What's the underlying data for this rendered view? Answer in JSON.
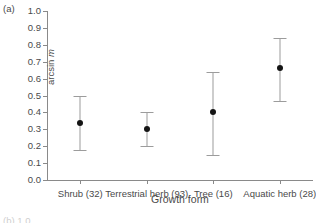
{
  "panel": {
    "letter": "(a)",
    "next_panel_letter": "(b) 1.0"
  },
  "chart_data": {
    "type": "scatter",
    "title": "",
    "xlabel": "Growth form",
    "ylabel": "arcsin m",
    "ylabel_plain": "arcsin",
    "ylabel_italic": "m",
    "ylim": [
      0.0,
      1.0
    ],
    "grid": false,
    "legend": "none",
    "error_type": "confidence-interval",
    "categories": [
      "Shrub (32)",
      "Terrestrial herb (93)",
      "Tree (16)",
      "Aquatic herb (28)"
    ],
    "category_names": [
      "Shrub",
      "Terrestrial herb",
      "Tree",
      "Aquatic herb"
    ],
    "sample_sizes": [
      32,
      93,
      16,
      28
    ],
    "values": [
      0.34,
      0.3,
      0.4,
      0.66
    ],
    "error_low": [
      0.18,
      0.2,
      0.15,
      0.47
    ],
    "error_high": [
      0.5,
      0.4,
      0.64,
      0.84
    ],
    "ytick_labels": [
      "1.0",
      "0.9",
      "0.8",
      "0.7",
      "0.6",
      "0.5",
      "0.4",
      "0.3",
      "0.2",
      "0.1",
      "0.0"
    ],
    "ytick_values": [
      1.0,
      0.9,
      0.8,
      0.7,
      0.6,
      0.5,
      0.4,
      0.3,
      0.2,
      0.1,
      0.0
    ],
    "colors": {
      "marker": "#141414",
      "errorbar": "#9c9c9c",
      "axis": "#8a8a8a",
      "text": "#4a4a4a",
      "background": "#ffffff"
    }
  }
}
